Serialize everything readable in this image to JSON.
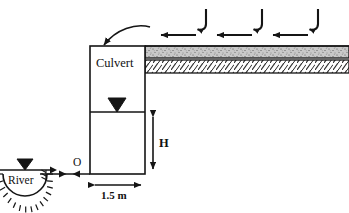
{
  "figure": {
    "stroke_color": "#151515",
    "soil_top_fill": "#c9c9c9",
    "soil_bottom_fill": "#ffffff",
    "background": "#ffffff"
  },
  "labels": {
    "culvert": "Culvert",
    "river": "River",
    "origin_point": "O",
    "height_dimension": "H",
    "width_dimension": "1.5 m"
  },
  "geometry": {
    "culvert_box": {
      "x": 90,
      "y": 46,
      "width": 55,
      "height": 128
    },
    "culvert_internal_divider_y": 112,
    "ground_line_y": 46,
    "soil_layer_boundary_y": 58,
    "soil_base_y": 73,
    "soil_right_edge_x": 349,
    "river_center_x": 25,
    "river_center_y": 174,
    "river_radius": 22,
    "height_dimension_x": 153,
    "height_dimension_from_y": 112,
    "height_dimension_to_y": 174,
    "width_dimension_y": 185
  },
  "annotations": {
    "load_arrow_count": 3,
    "load_arrow_x_positions": [
      204,
      260,
      316
    ],
    "flow_arrow_count": 3,
    "flow_arrow_x_positions": [
      178,
      234,
      290
    ],
    "flow_arrow_y": 35,
    "seepage_arrowheads": [
      64,
      76
    ],
    "leader_arrow_from": [
      150,
      28
    ],
    "leader_arrow_to": [
      103,
      49
    ],
    "water_table_symbols": [
      {
        "name": "culvert-water-table",
        "x": 117,
        "y": 112
      },
      {
        "name": "river-water-table",
        "x": 25,
        "y": 170
      }
    ]
  }
}
